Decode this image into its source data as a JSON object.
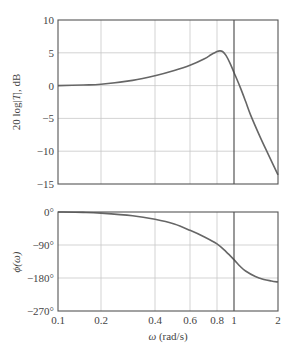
{
  "chart_data": [
    {
      "type": "line",
      "name": "magnitude",
      "title": "",
      "xlabel": "",
      "ylabel": "20 log|T|, dB",
      "ylabel_parts": [
        "20 log|",
        "T",
        "|, dB"
      ],
      "xscale": "log",
      "xlim": [
        0.1,
        2
      ],
      "ylim": [
        -15,
        10
      ],
      "yticks": [
        10,
        5,
        0,
        -5,
        -10,
        -15
      ],
      "ytick_labels": [
        "10",
        "5",
        "0",
        "−5",
        "−10",
        "−15"
      ],
      "xgrid": [
        0.2,
        0.4,
        0.6,
        0.8
      ],
      "vline": 1,
      "grid": true,
      "series": [
        {
          "name": "20 log|T|",
          "x": [
            0.1,
            0.15,
            0.2,
            0.3,
            0.4,
            0.5,
            0.6,
            0.7,
            0.75,
            0.8,
            0.83,
            0.86,
            0.9,
            0.95,
            1.0,
            1.1,
            1.2,
            1.3,
            1.5,
            1.7,
            2.0
          ],
          "y": [
            0.0,
            0.1,
            0.2,
            0.8,
            1.5,
            2.3,
            3.1,
            4.1,
            4.7,
            5.2,
            5.3,
            5.2,
            4.6,
            3.4,
            2.0,
            -0.2,
            -2.4,
            -4.5,
            -7.7,
            -10.3,
            -13.6
          ]
        }
      ]
    },
    {
      "type": "line",
      "name": "phase",
      "title": "",
      "xlabel": "ω (rad/s)",
      "ylabel": "ϕ(ω)",
      "xscale": "log",
      "xlim": [
        0.1,
        2
      ],
      "ylim": [
        -270,
        0
      ],
      "yticks": [
        0,
        -90,
        -180,
        -270
      ],
      "ytick_labels": [
        "0°",
        "−90°",
        "−180°",
        "−270°"
      ],
      "xticks": [
        0.1,
        0.2,
        0.4,
        0.6,
        0.8,
        1,
        2
      ],
      "xtick_labels": [
        "0.1",
        "0.2",
        "0.4",
        "0.6",
        "0.8",
        "1",
        "2"
      ],
      "xgrid": [
        0.2,
        0.4,
        0.6,
        0.8
      ],
      "vline": 1,
      "grid": true,
      "series": [
        {
          "name": "ϕ(ω)",
          "x": [
            0.1,
            0.15,
            0.2,
            0.3,
            0.4,
            0.5,
            0.6,
            0.7,
            0.8,
            0.9,
            1.0,
            1.1,
            1.2,
            1.4,
            1.6,
            1.8,
            2.0
          ],
          "y": [
            0,
            -1,
            -3,
            -10,
            -20,
            -33,
            -50,
            -68,
            -87,
            -108,
            -130,
            -148,
            -161,
            -176,
            -184,
            -188,
            -191
          ]
        }
      ]
    }
  ]
}
